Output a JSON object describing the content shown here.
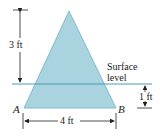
{
  "diagram": {
    "shape": "isosceles-triangle",
    "colors": {
      "fill": "#a9d3df",
      "edge": "#6fb0c6",
      "surface_line": "#4a9ab8",
      "dimension": "#222222"
    },
    "labels": {
      "height": "3 ft",
      "surface": [
        "Surface",
        "level"
      ],
      "depth": "1 ft",
      "base": "4 ft",
      "vertex_left": "A",
      "vertex_right": "B"
    }
  }
}
